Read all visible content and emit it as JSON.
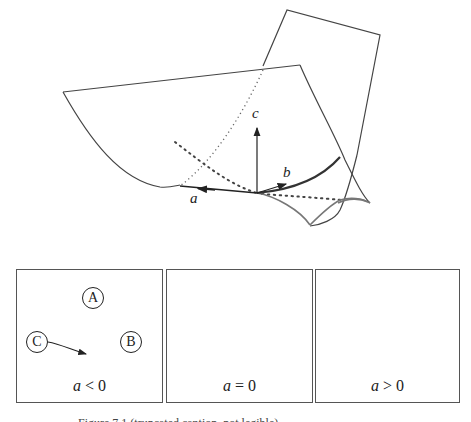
{
  "figure": {
    "axes": {
      "a": "a",
      "b": "b",
      "c": "c"
    },
    "colors": {
      "line": "#333333",
      "curve": "#555555",
      "thick_curve": "#444444",
      "dotted": "#555555"
    }
  },
  "panels": [
    {
      "id": "a-negative",
      "label_var": "a",
      "label_rel": "< 0",
      "regions": [
        {
          "name": "A",
          "label": "A"
        },
        {
          "name": "B",
          "label": "B"
        },
        {
          "name": "C",
          "label": "C"
        }
      ]
    },
    {
      "id": "a-zero",
      "label_var": "a",
      "label_rel": "= 0"
    },
    {
      "id": "a-positive",
      "label_var": "a",
      "label_rel": "> 0"
    }
  ],
  "caption": {
    "text": "Figure 7.1  (truncated caption, not legible)"
  }
}
